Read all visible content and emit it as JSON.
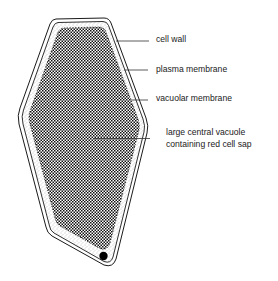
{
  "diagram": {
    "labels": {
      "cell_wall": "cell wall",
      "plasma_membrane": "plasma membrane",
      "vacuolar_membrane": "vacuolar membrane",
      "vacuole_line1": "large central vacuole",
      "vacuole_line2": "containing red cell sap"
    },
    "colors": {
      "outline": "#1a1a1a",
      "background": "#ffffff",
      "vacuole_dots": "#111111",
      "cytoplasm_stipple": "#9a9a9a",
      "nucleus": "#000000"
    }
  }
}
